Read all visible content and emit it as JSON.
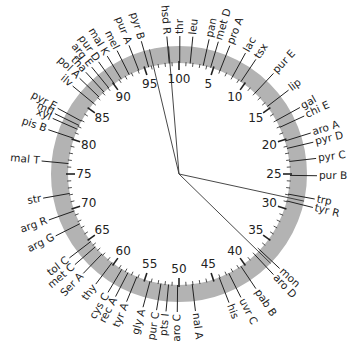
{
  "diagram": {
    "type": "circular-genetic-map",
    "center": [
      179,
      174
    ],
    "ring": {
      "outer_radius": 128,
      "inner_radius": 111,
      "color": "#b3b3b3"
    },
    "scale": {
      "min": 0,
      "max": 100,
      "major_step": 5,
      "minor_step": 1,
      "major_labels": [
        "100",
        "5",
        "10",
        "15",
        "20",
        "25",
        "30",
        "35",
        "40",
        "45",
        "50",
        "55",
        "60",
        "65",
        "70",
        "75",
        "80",
        "85",
        "90",
        "95"
      ]
    },
    "genes": [
      {
        "name": "hsd R",
        "pos": 98.6
      },
      {
        "name": "thr",
        "pos": 0.1
      },
      {
        "name": "leu",
        "pos": 1.6
      },
      {
        "name": "pan",
        "pos": 3.5
      },
      {
        "name": "met D",
        "pos": 4.6
      },
      {
        "name": "pro A",
        "pos": 6.0
      },
      {
        "name": "lac",
        "pos": 8.0
      },
      {
        "name": "tsx",
        "pos": 9.4
      },
      {
        "name": "pur E",
        "pos": 12.0
      },
      {
        "name": "lip",
        "pos": 14.6
      },
      {
        "name": "gal",
        "pos": 17.0
      },
      {
        "name": "chi E",
        "pos": 18.1
      },
      {
        "name": "aro A",
        "pos": 20.2
      },
      {
        "name": "pyr D",
        "pos": 21.3
      },
      {
        "name": "pyr C",
        "pos": 23.2
      },
      {
        "name": "pur B",
        "pos": 25.2
      },
      {
        "name": "trp",
        "pos": 27.9
      },
      {
        "name": "tyr R",
        "pos": 28.9
      },
      {
        "name": "mon",
        "pos": 37.0
      },
      {
        "name": "aro D",
        "pos": 38.0
      },
      {
        "name": "pab B",
        "pos": 40.6
      },
      {
        "name": "uvr C",
        "pos": 42.6
      },
      {
        "name": "his",
        "pos": 44.1
      },
      {
        "name": "nal A",
        "pos": 48.1
      },
      {
        "name": "aro C",
        "pos": 50.2
      },
      {
        "name": "pts I",
        "pos": 51.5
      },
      {
        "name": "pur C",
        "pos": 52.6
      },
      {
        "name": "gly A",
        "pos": 54.2
      },
      {
        "name": "tyr A",
        "pos": 56.2
      },
      {
        "name": "rec A",
        "pos": 57.6
      },
      {
        "name": "cys C",
        "pos": 58.6
      },
      {
        "name": "thy",
        "pos": 60.3
      },
      {
        "name": "Ser A",
        "pos": 62.2
      },
      {
        "name": "met C",
        "pos": 63.6
      },
      {
        "name": "tol C",
        "pos": 64.6
      },
      {
        "name": "arg G",
        "pos": 67.6
      },
      {
        "name": "arg R",
        "pos": 69.6
      },
      {
        "name": "str",
        "pos": 72.2
      },
      {
        "name": "mal T",
        "pos": 76.5
      },
      {
        "name": "pis B",
        "pos": 80.2
      },
      {
        "name": "xyl",
        "pos": 81.6
      },
      {
        "name": "mtl",
        "pos": 82.2
      },
      {
        "name": "pyr E",
        "pos": 82.9
      },
      {
        "name": "ilv",
        "pos": 86.0
      },
      {
        "name": "pol A",
        "pos": 87.2
      },
      {
        "name": "tha",
        "pos": 88.2
      },
      {
        "name": "arg E",
        "pos": 89.1
      },
      {
        "name": "pur D",
        "pos": 90.1
      },
      {
        "name": "mal K",
        "pos": 91.3
      },
      {
        "name": "mel",
        "pos": 92.6
      },
      {
        "name": "pur A",
        "pos": 94.1
      },
      {
        "name": "pyr B",
        "pos": 95.6
      }
    ],
    "center_lines": [
      96.3,
      98.7,
      28.4,
      37.3
    ]
  }
}
